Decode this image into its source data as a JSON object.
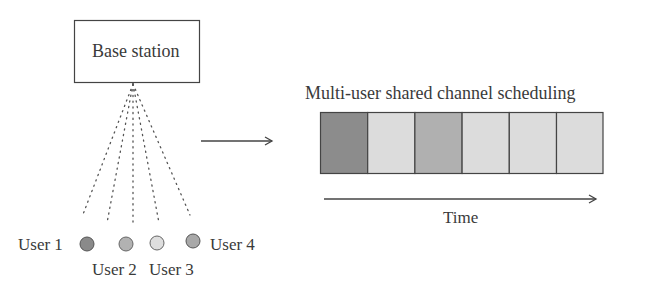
{
  "base_station": {
    "label": "Base station"
  },
  "users": [
    {
      "label": "User 1",
      "color": "#8a8a8a"
    },
    {
      "label": "User 2",
      "color": "#b2b2b2"
    },
    {
      "label": "User 3",
      "color": "#dedede"
    },
    {
      "label": "User 4",
      "color": "#a8a8a8"
    }
  ],
  "channel": {
    "title": "Multi-user shared channel scheduling",
    "slots": [
      {
        "color": "#8c8c8c"
      },
      {
        "color": "#dcdcdc"
      },
      {
        "color": "#b0b0b0"
      },
      {
        "color": "#dcdcdc"
      },
      {
        "color": "#dcdcdc"
      },
      {
        "color": "#dcdcdc"
      }
    ],
    "time_label": "Time"
  }
}
